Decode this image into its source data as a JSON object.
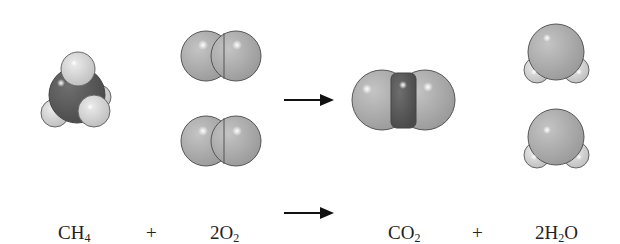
{
  "equation": {
    "reactant1": {
      "coef": "",
      "base": "CH",
      "sub": "4",
      "tail": ""
    },
    "plus1": "+",
    "reactant2": {
      "coef": "2",
      "base": "O",
      "sub": "2",
      "tail": ""
    },
    "product1": {
      "coef": "",
      "base": "CO",
      "sub": "2",
      "tail": ""
    },
    "plus2": "+",
    "product2": {
      "coef": "2",
      "base": "H",
      "sub": "2",
      "tail": "O"
    }
  },
  "colors": {
    "carbon": "#5a5a5a",
    "oxygen": "#a8a8a8",
    "hydrogen": "#d2d2d2",
    "outline": "#555555",
    "arrow": "#111111"
  },
  "molecules": [
    {
      "name": "methane",
      "count": 1
    },
    {
      "name": "oxygen",
      "count": 2
    },
    {
      "name": "carbon-dioxide",
      "count": 1
    },
    {
      "name": "water",
      "count": 2
    }
  ]
}
